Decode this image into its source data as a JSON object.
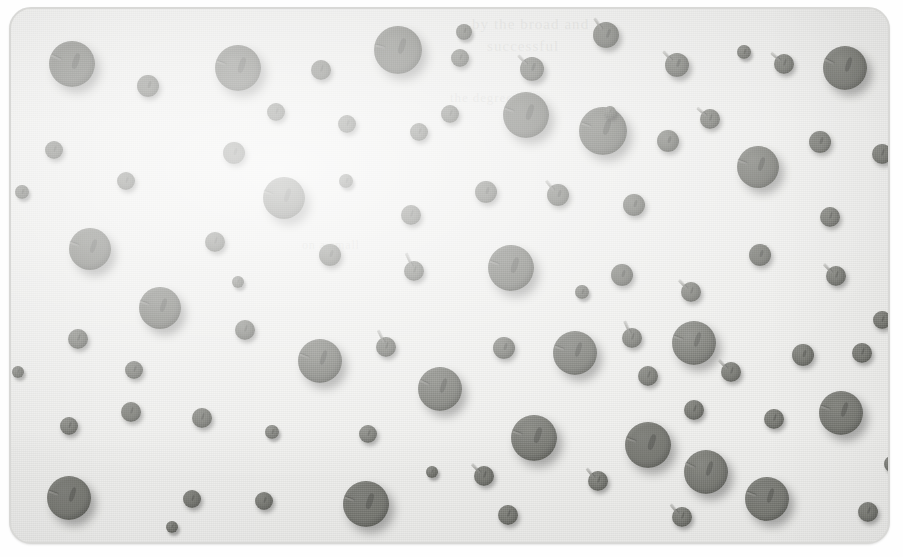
{
  "figure": {
    "kind": "scanned-halftone-photograph",
    "panel": {
      "corner_radius_px": 22,
      "background_color": "#f1f1ef",
      "border_color": "#d8d8d6",
      "left": 9,
      "top": 7,
      "width": 877,
      "height": 533
    },
    "pin_color": "#74756f",
    "shadow_color": "rgba(40,40,40,0.34)",
    "stem_color": "#8c8c88",
    "total_pins": 88
  },
  "ghost_text": [
    {
      "text": "by the broad and",
      "x": 470,
      "y": 14,
      "size": 15
    },
    {
      "text": "successful",
      "x": 485,
      "y": 36,
      "size": 15
    },
    {
      "text": "the degree",
      "x": 448,
      "y": 88,
      "size": 13
    },
    {
      "text": "on a small",
      "x": 300,
      "y": 236,
      "size": 12
    }
  ],
  "pins": [
    {
      "cx": 70,
      "cy": 62,
      "r": 23,
      "stem": 205,
      "stem_len": 11
    },
    {
      "cx": 146,
      "cy": 84,
      "r": 11,
      "stem": null,
      "stem_len": 0
    },
    {
      "cx": 236,
      "cy": 66,
      "r": 23,
      "stem": 200,
      "stem_len": 10
    },
    {
      "cx": 319,
      "cy": 68,
      "r": 10,
      "stem": null,
      "stem_len": 0
    },
    {
      "cx": 396,
      "cy": 48,
      "r": 24,
      "stem": 195,
      "stem_len": 10
    },
    {
      "cx": 458,
      "cy": 56,
      "r": 9,
      "stem": null,
      "stem_len": 0
    },
    {
      "cx": 530,
      "cy": 67,
      "r": 12,
      "stem": 225,
      "stem_len": 13
    },
    {
      "cx": 604,
      "cy": 33,
      "r": 13,
      "stem": 235,
      "stem_len": 14
    },
    {
      "cx": 675,
      "cy": 63,
      "r": 12,
      "stem": 225,
      "stem_len": 13
    },
    {
      "cx": 782,
      "cy": 62,
      "r": 10,
      "stem": 220,
      "stem_len": 12
    },
    {
      "cx": 843,
      "cy": 66,
      "r": 22,
      "stem": 205,
      "stem_len": 11
    },
    {
      "cx": 52,
      "cy": 148,
      "r": 9,
      "stem": null,
      "stem_len": 0
    },
    {
      "cx": 124,
      "cy": 179,
      "r": 9,
      "stem": null,
      "stem_len": 0
    },
    {
      "cx": 232,
      "cy": 151,
      "r": 11,
      "stem": null,
      "stem_len": 0
    },
    {
      "cx": 274,
      "cy": 110,
      "r": 9,
      "stem": null,
      "stem_len": 0
    },
    {
      "cx": 345,
      "cy": 122,
      "r": 9,
      "stem": null,
      "stem_len": 0
    },
    {
      "cx": 417,
      "cy": 130,
      "r": 9,
      "stem": null,
      "stem_len": 0
    },
    {
      "cx": 524,
      "cy": 113,
      "r": 23,
      "stem": 200,
      "stem_len": 10
    },
    {
      "cx": 601,
      "cy": 129,
      "r": 24,
      "stem": 200,
      "stem_len": 10
    },
    {
      "cx": 666,
      "cy": 139,
      "r": 11,
      "stem": null,
      "stem_len": 0
    },
    {
      "cx": 708,
      "cy": 117,
      "r": 10,
      "stem": 220,
      "stem_len": 12
    },
    {
      "cx": 756,
      "cy": 165,
      "r": 21,
      "stem": 200,
      "stem_len": 10
    },
    {
      "cx": 818,
      "cy": 140,
      "r": 11,
      "stem": null,
      "stem_len": 0
    },
    {
      "cx": 880,
      "cy": 152,
      "r": 10,
      "stem": null,
      "stem_len": 0
    },
    {
      "cx": 282,
      "cy": 196,
      "r": 21,
      "stem": 200,
      "stem_len": 10
    },
    {
      "cx": 484,
      "cy": 190,
      "r": 11,
      "stem": null,
      "stem_len": 0
    },
    {
      "cx": 556,
      "cy": 193,
      "r": 11,
      "stem": 230,
      "stem_len": 13
    },
    {
      "cx": 632,
      "cy": 203,
      "r": 11,
      "stem": null,
      "stem_len": 0
    },
    {
      "cx": 88,
      "cy": 247,
      "r": 21,
      "stem": 200,
      "stem_len": 10
    },
    {
      "cx": 213,
      "cy": 240,
      "r": 10,
      "stem": null,
      "stem_len": 0
    },
    {
      "cx": 328,
      "cy": 253,
      "r": 11,
      "stem": null,
      "stem_len": 0
    },
    {
      "cx": 409,
      "cy": 213,
      "r": 10,
      "stem": null,
      "stem_len": 0
    },
    {
      "cx": 412,
      "cy": 269,
      "r": 10,
      "stem": 245,
      "stem_len": 15
    },
    {
      "cx": 509,
      "cy": 266,
      "r": 23,
      "stem": 200,
      "stem_len": 10
    },
    {
      "cx": 620,
      "cy": 273,
      "r": 11,
      "stem": null,
      "stem_len": 0
    },
    {
      "cx": 689,
      "cy": 290,
      "r": 10,
      "stem": 225,
      "stem_len": 12
    },
    {
      "cx": 758,
      "cy": 253,
      "r": 11,
      "stem": null,
      "stem_len": 0
    },
    {
      "cx": 828,
      "cy": 215,
      "r": 10,
      "stem": null,
      "stem_len": 0
    },
    {
      "cx": 834,
      "cy": 274,
      "r": 10,
      "stem": 225,
      "stem_len": 12
    },
    {
      "cx": 158,
      "cy": 306,
      "r": 21,
      "stem": 200,
      "stem_len": 10
    },
    {
      "cx": 76,
      "cy": 337,
      "r": 10,
      "stem": null,
      "stem_len": 0
    },
    {
      "cx": 243,
      "cy": 328,
      "r": 10,
      "stem": null,
      "stem_len": 0
    },
    {
      "cx": 132,
      "cy": 368,
      "r": 9,
      "stem": null,
      "stem_len": 0
    },
    {
      "cx": 318,
      "cy": 359,
      "r": 22,
      "stem": 200,
      "stem_len": 10
    },
    {
      "cx": 384,
      "cy": 345,
      "r": 10,
      "stem": 243,
      "stem_len": 14
    },
    {
      "cx": 438,
      "cy": 387,
      "r": 22,
      "stem": 205,
      "stem_len": 10
    },
    {
      "cx": 502,
      "cy": 346,
      "r": 11,
      "stem": null,
      "stem_len": 0
    },
    {
      "cx": 573,
      "cy": 351,
      "r": 22,
      "stem": 200,
      "stem_len": 10
    },
    {
      "cx": 630,
      "cy": 336,
      "r": 10,
      "stem": 245,
      "stem_len": 14
    },
    {
      "cx": 692,
      "cy": 341,
      "r": 22,
      "stem": 200,
      "stem_len": 10
    },
    {
      "cx": 646,
      "cy": 374,
      "r": 10,
      "stem": null,
      "stem_len": 0
    },
    {
      "cx": 729,
      "cy": 370,
      "r": 10,
      "stem": 225,
      "stem_len": 12
    },
    {
      "cx": 801,
      "cy": 353,
      "r": 11,
      "stem": null,
      "stem_len": 0
    },
    {
      "cx": 860,
      "cy": 351,
      "r": 10,
      "stem": null,
      "stem_len": 0
    },
    {
      "cx": 67,
      "cy": 424,
      "r": 9,
      "stem": null,
      "stem_len": 0
    },
    {
      "cx": 129,
      "cy": 410,
      "r": 10,
      "stem": null,
      "stem_len": 0
    },
    {
      "cx": 200,
      "cy": 416,
      "r": 10,
      "stem": null,
      "stem_len": 0
    },
    {
      "cx": 366,
      "cy": 432,
      "r": 9,
      "stem": null,
      "stem_len": 0
    },
    {
      "cx": 482,
      "cy": 474,
      "r": 10,
      "stem": 225,
      "stem_len": 12
    },
    {
      "cx": 532,
      "cy": 436,
      "r": 23,
      "stem": 200,
      "stem_len": 10
    },
    {
      "cx": 596,
      "cy": 479,
      "r": 10,
      "stem": 230,
      "stem_len": 12
    },
    {
      "cx": 646,
      "cy": 443,
      "r": 23,
      "stem": 200,
      "stem_len": 10
    },
    {
      "cx": 692,
      "cy": 408,
      "r": 10,
      "stem": null,
      "stem_len": 0
    },
    {
      "cx": 704,
      "cy": 470,
      "r": 22,
      "stem": 205,
      "stem_len": 11
    },
    {
      "cx": 772,
      "cy": 417,
      "r": 10,
      "stem": null,
      "stem_len": 0
    },
    {
      "cx": 839,
      "cy": 411,
      "r": 22,
      "stem": 200,
      "stem_len": 10
    },
    {
      "cx": 67,
      "cy": 496,
      "r": 22,
      "stem": 200,
      "stem_len": 10
    },
    {
      "cx": 190,
      "cy": 497,
      "r": 9,
      "stem": null,
      "stem_len": 0
    },
    {
      "cx": 262,
      "cy": 499,
      "r": 9,
      "stem": null,
      "stem_len": 0
    },
    {
      "cx": 364,
      "cy": 502,
      "r": 23,
      "stem": 200,
      "stem_len": 10
    },
    {
      "cx": 506,
      "cy": 513,
      "r": 10,
      "stem": null,
      "stem_len": 0
    },
    {
      "cx": 680,
      "cy": 515,
      "r": 10,
      "stem": 230,
      "stem_len": 12
    },
    {
      "cx": 765,
      "cy": 497,
      "r": 22,
      "stem": 200,
      "stem_len": 10
    },
    {
      "cx": 866,
      "cy": 510,
      "r": 10,
      "stem": null,
      "stem_len": 0
    },
    {
      "cx": 448,
      "cy": 112,
      "r": 9,
      "stem": null,
      "stem_len": 0
    },
    {
      "cx": 344,
      "cy": 179,
      "r": 7,
      "stem": null,
      "stem_len": 0
    },
    {
      "cx": 880,
      "cy": 318,
      "r": 9,
      "stem": null,
      "stem_len": 0
    },
    {
      "cx": 20,
      "cy": 190,
      "r": 7,
      "stem": null,
      "stem_len": 0
    },
    {
      "cx": 16,
      "cy": 370,
      "r": 6,
      "stem": null,
      "stem_len": 0
    },
    {
      "cx": 890,
      "cy": 462,
      "r": 8,
      "stem": null,
      "stem_len": 0
    },
    {
      "cx": 462,
      "cy": 30,
      "r": 8,
      "stem": null,
      "stem_len": 0
    },
    {
      "cx": 742,
      "cy": 50,
      "r": 7,
      "stem": null,
      "stem_len": 0
    },
    {
      "cx": 270,
      "cy": 430,
      "r": 7,
      "stem": null,
      "stem_len": 0
    },
    {
      "cx": 580,
      "cy": 290,
      "r": 7,
      "stem": null,
      "stem_len": 0
    },
    {
      "cx": 170,
      "cy": 525,
      "r": 6,
      "stem": null,
      "stem_len": 0
    },
    {
      "cx": 430,
      "cy": 470,
      "r": 6,
      "stem": null,
      "stem_len": 0
    },
    {
      "cx": 608,
      "cy": 110,
      "r": 6,
      "stem": null,
      "stem_len": 0
    },
    {
      "cx": 236,
      "cy": 280,
      "r": 6,
      "stem": null,
      "stem_len": 0
    }
  ]
}
